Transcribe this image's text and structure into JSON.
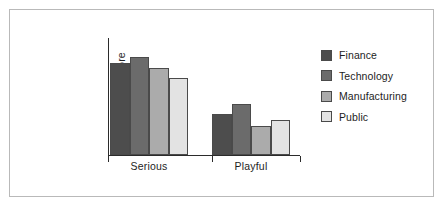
{
  "chart_data": {
    "type": "bar",
    "title": "",
    "xlabel": "",
    "ylabel": "Mean AMSP score",
    "categories": [
      "Serious",
      "Playful"
    ],
    "ylim": [
      0,
      100
    ],
    "grid": false,
    "legend_position": "right",
    "series": [
      {
        "name": "Finance",
        "color": "#4d4d4d",
        "values": [
          79,
          35
        ]
      },
      {
        "name": "Technology",
        "color": "#6b6b6b",
        "values": [
          84,
          44
        ]
      },
      {
        "name": "Manufacturing",
        "color": "#ababab",
        "values": [
          74,
          25
        ]
      },
      {
        "name": "Public",
        "color": "#e3e3e3",
        "values": [
          66,
          30
        ]
      }
    ],
    "axis_color": "#2b2b2b",
    "bar_edge_color": "#4a4a4a",
    "frame_color": "#b9b9b9",
    "background": "#ffffff"
  },
  "tick_labels": [
    "Serious",
    "Playful"
  ]
}
